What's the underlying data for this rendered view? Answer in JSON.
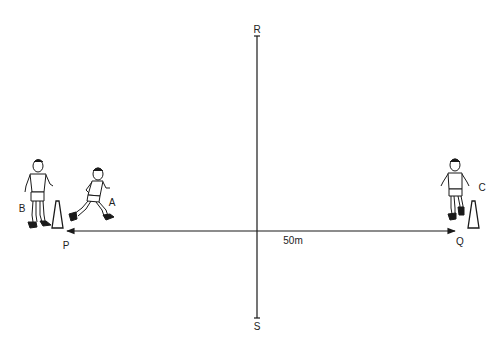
{
  "diagram": {
    "points": {
      "R": "R",
      "S": "S",
      "P": "P",
      "Q": "Q"
    },
    "players": {
      "A": "A",
      "B": "B",
      "C": "C"
    },
    "distance_label": "50m",
    "colors": {
      "ink": "#1a1a1a",
      "background": "#ffffff"
    }
  }
}
